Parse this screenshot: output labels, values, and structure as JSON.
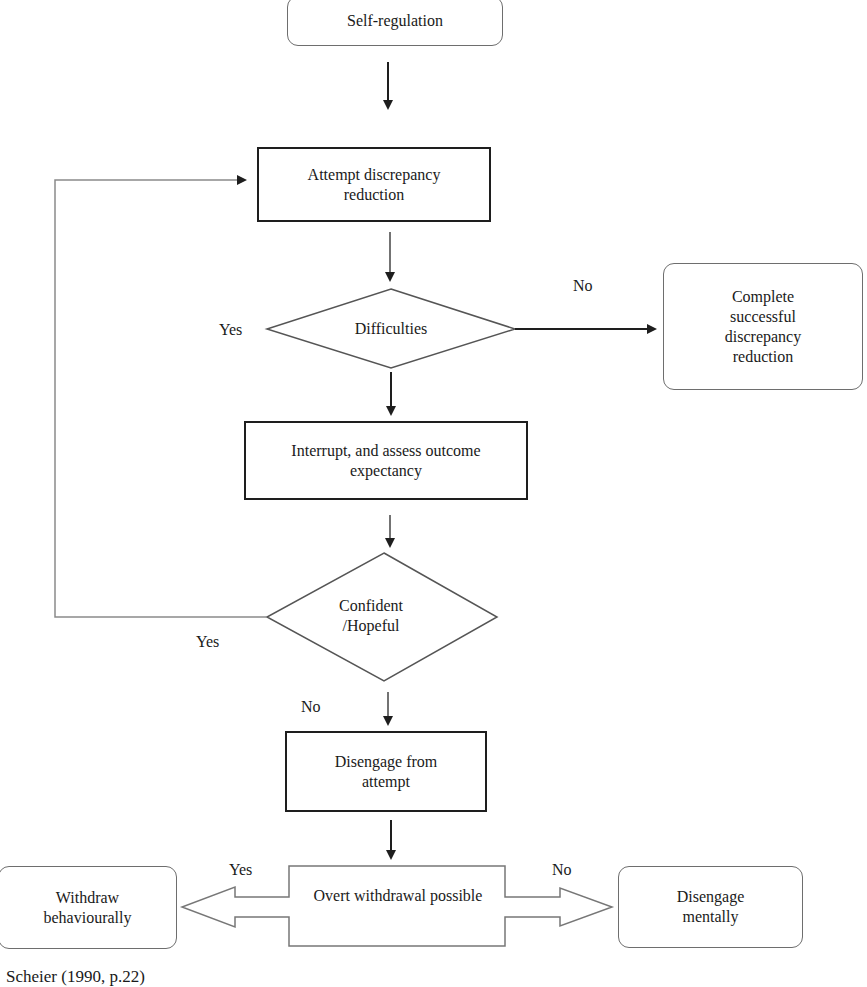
{
  "diagram": {
    "nodes": {
      "self_regulation": "Self-regulation",
      "attempt": "Attempt discrepancy reduction",
      "difficulties": "Difficulties",
      "complete": "Complete successful discrepancy reduction",
      "interrupt": "Interrupt, and assess outcome expectancy",
      "confident": "Confident /Hopeful",
      "disengage_attempt": "Disengage from attempt",
      "overt": "Overt withdrawal possible",
      "withdraw": "Withdraw behaviourally",
      "disengage_mentally": "Disengage mentally"
    },
    "edge_labels": {
      "difficulties_no": "No",
      "difficulties_yes": "Yes",
      "confident_yes": "Yes",
      "confident_no": "No",
      "overt_yes": "Yes",
      "overt_no": "No"
    },
    "caption": "Scheier (1990, p.22)",
    "colors": {
      "line": "#1e1e1e",
      "feedback_line": "#8a8a8a",
      "rounded_border": "#6e6e6e"
    }
  }
}
